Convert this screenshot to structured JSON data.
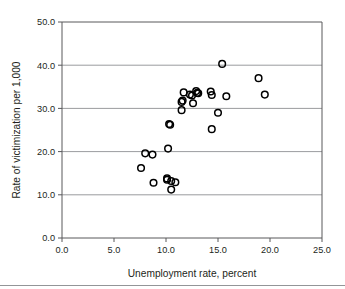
{
  "chart_data": {
    "type": "scatter",
    "title": "",
    "xlabel": "Unemployment rate, percent",
    "ylabel": "Rate of victimization per 1,000",
    "xlim": [
      0.0,
      25.0
    ],
    "ylim": [
      0.0,
      50.0
    ],
    "xticks": [
      "0.0",
      "5.0",
      "10.0",
      "15.0",
      "20.0",
      "25.0"
    ],
    "xtick_values": [
      0.0,
      5.0,
      10.0,
      15.0,
      20.0,
      25.0
    ],
    "yticks": [
      "0.0",
      "10.0",
      "20.0",
      "30.0",
      "40.0",
      "50.0"
    ],
    "ytick_values": [
      0.0,
      10.0,
      20.0,
      30.0,
      40.0,
      50.0
    ],
    "grid": "horizontal",
    "legend": "none",
    "marker_style": "open-circle",
    "marker_color": "#000000",
    "points": [
      {
        "x": 7.6,
        "y": 16.2
      },
      {
        "x": 8.0,
        "y": 19.6
      },
      {
        "x": 8.7,
        "y": 19.3
      },
      {
        "x": 8.8,
        "y": 12.8
      },
      {
        "x": 10.1,
        "y": 13.5
      },
      {
        "x": 10.1,
        "y": 13.8
      },
      {
        "x": 10.2,
        "y": 20.7
      },
      {
        "x": 10.3,
        "y": 26.4
      },
      {
        "x": 10.4,
        "y": 26.2
      },
      {
        "x": 10.5,
        "y": 13.2
      },
      {
        "x": 10.5,
        "y": 11.2
      },
      {
        "x": 10.9,
        "y": 12.9
      },
      {
        "x": 11.5,
        "y": 29.6
      },
      {
        "x": 11.5,
        "y": 31.5
      },
      {
        "x": 11.6,
        "y": 31.8
      },
      {
        "x": 11.7,
        "y": 33.7
      },
      {
        "x": 12.3,
        "y": 33.2
      },
      {
        "x": 12.5,
        "y": 33.0
      },
      {
        "x": 12.6,
        "y": 31.2
      },
      {
        "x": 12.9,
        "y": 34.0
      },
      {
        "x": 13.0,
        "y": 33.6
      },
      {
        "x": 13.1,
        "y": 33.5
      },
      {
        "x": 14.3,
        "y": 33.9
      },
      {
        "x": 14.4,
        "y": 33.1
      },
      {
        "x": 14.4,
        "y": 25.2
      },
      {
        "x": 15.0,
        "y": 29.0
      },
      {
        "x": 15.4,
        "y": 40.3
      },
      {
        "x": 15.8,
        "y": 32.8
      },
      {
        "x": 18.9,
        "y": 37.0
      },
      {
        "x": 19.5,
        "y": 33.2
      }
    ]
  },
  "colors": {
    "axis": "#58585b",
    "grid": "#808285",
    "marker": "#000000",
    "text": "#231f20",
    "background": "#ffffff"
  }
}
